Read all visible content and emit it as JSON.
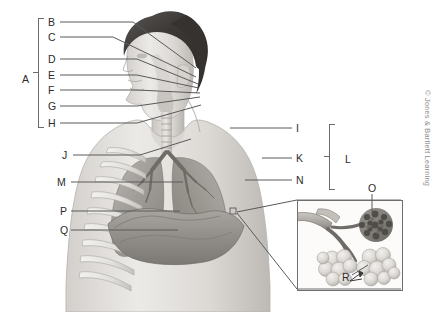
{
  "figure": {
    "copyright": "© Jones & Bartlett Learning",
    "line_color": "#5a5a5a",
    "label_color": "#2b2b2b",
    "bracket_color": "#6b6b6b",
    "inset_border_color": "#6e6e6e",
    "background": "#ffffff"
  },
  "brackets": [
    {
      "id": "A",
      "label": "A",
      "label_x": 22,
      "label_y": 74,
      "x": 38,
      "y": 18,
      "height": 108
    },
    {
      "id": "L",
      "label": "L",
      "label_x": 345,
      "label_y": 154,
      "x": 329,
      "y": 124,
      "height": 64
    }
  ],
  "labels": [
    {
      "id": "B",
      "label": "B",
      "x": 48,
      "y": 17,
      "line": {
        "x1": 60,
        "y1": 22,
        "x2": 133,
        "y2": 22
      },
      "line2": {
        "x1": 133,
        "y1": 22,
        "x2": 196,
        "y2": 68
      }
    },
    {
      "id": "C",
      "label": "C",
      "x": 48,
      "y": 32,
      "line": {
        "x1": 60,
        "y1": 37,
        "x2": 113,
        "y2": 37
      },
      "line2": {
        "x1": 113,
        "y1": 37,
        "x2": 196,
        "y2": 77
      }
    },
    {
      "id": "D",
      "label": "D",
      "x": 48,
      "y": 54,
      "line": {
        "x1": 60,
        "y1": 59,
        "x2": 137,
        "y2": 59
      },
      "line2": {
        "x1": 137,
        "y1": 59,
        "x2": 198,
        "y2": 84
      }
    },
    {
      "id": "E",
      "label": "E",
      "x": 48,
      "y": 70,
      "line": {
        "x1": 60,
        "y1": 75,
        "x2": 137,
        "y2": 75
      },
      "line2": {
        "x1": 137,
        "y1": 75,
        "x2": 199,
        "y2": 88
      }
    },
    {
      "id": "F",
      "label": "F",
      "x": 48,
      "y": 85,
      "line": {
        "x1": 60,
        "y1": 90,
        "x2": 137,
        "y2": 90
      },
      "line2": {
        "x1": 137,
        "y1": 90,
        "x2": 200,
        "y2": 93
      }
    },
    {
      "id": "G",
      "label": "G",
      "x": 48,
      "y": 101,
      "line": {
        "x1": 60,
        "y1": 106,
        "x2": 137,
        "y2": 106
      },
      "line2": {
        "x1": 137,
        "y1": 106,
        "x2": 200,
        "y2": 97
      }
    },
    {
      "id": "H",
      "label": "H",
      "x": 48,
      "y": 118,
      "line": {
        "x1": 60,
        "y1": 123,
        "x2": 137,
        "y2": 123
      },
      "line2": {
        "x1": 137,
        "y1": 123,
        "x2": 201,
        "y2": 105
      }
    },
    {
      "id": "J",
      "label": "J",
      "x": 62,
      "y": 150,
      "line": {
        "x1": 73,
        "y1": 155,
        "x2": 140,
        "y2": 155
      },
      "line2": {
        "x1": 140,
        "y1": 155,
        "x2": 191,
        "y2": 139
      }
    },
    {
      "id": "M",
      "label": "M",
      "x": 57,
      "y": 177,
      "line": {
        "x1": 71,
        "y1": 182,
        "x2": 183,
        "y2": 182
      },
      "line2": null
    },
    {
      "id": "P",
      "label": "P",
      "x": 60,
      "y": 206,
      "line": {
        "x1": 71,
        "y1": 211,
        "x2": 180,
        "y2": 211
      },
      "line2": null
    },
    {
      "id": "Q",
      "label": "Q",
      "x": 60,
      "y": 225,
      "line": {
        "x1": 71,
        "y1": 230,
        "x2": 178,
        "y2": 230
      },
      "line2": null
    },
    {
      "id": "I",
      "label": "I",
      "x": 296,
      "y": 123,
      "line": {
        "x1": 230,
        "y1": 128,
        "x2": 292,
        "y2": 128
      },
      "line2": null
    },
    {
      "id": "K",
      "label": "K",
      "x": 296,
      "y": 153,
      "line": {
        "x1": 262,
        "y1": 158,
        "x2": 292,
        "y2": 158
      },
      "line2": null
    },
    {
      "id": "N",
      "label": "N",
      "x": 296,
      "y": 175,
      "line": {
        "x1": 245,
        "y1": 180,
        "x2": 292,
        "y2": 180
      },
      "line2": null
    },
    {
      "id": "O",
      "label": "O",
      "x": 368,
      "y": 183,
      "line": {
        "x1": 372,
        "y1": 194,
        "x2": 372,
        "y2": 212
      },
      "line2": null
    },
    {
      "id": "R",
      "label": "R",
      "x": 342,
      "y": 272,
      "line": {
        "x1": 352,
        "y1": 275,
        "x2": 368,
        "y2": 265
      },
      "line2": null
    }
  ],
  "inset": {
    "name": "alveoli-detail-inset",
    "x": 297,
    "y": 200,
    "width": 104,
    "height": 89,
    "connector_top": {
      "x1": 237,
      "y1": 214,
      "x2": 297,
      "y2": 200
    },
    "connector_bottom": {
      "x1": 237,
      "y1": 216,
      "x2": 297,
      "y2": 289
    },
    "source_marker": {
      "x": 233,
      "y": 211,
      "size": 6
    }
  }
}
